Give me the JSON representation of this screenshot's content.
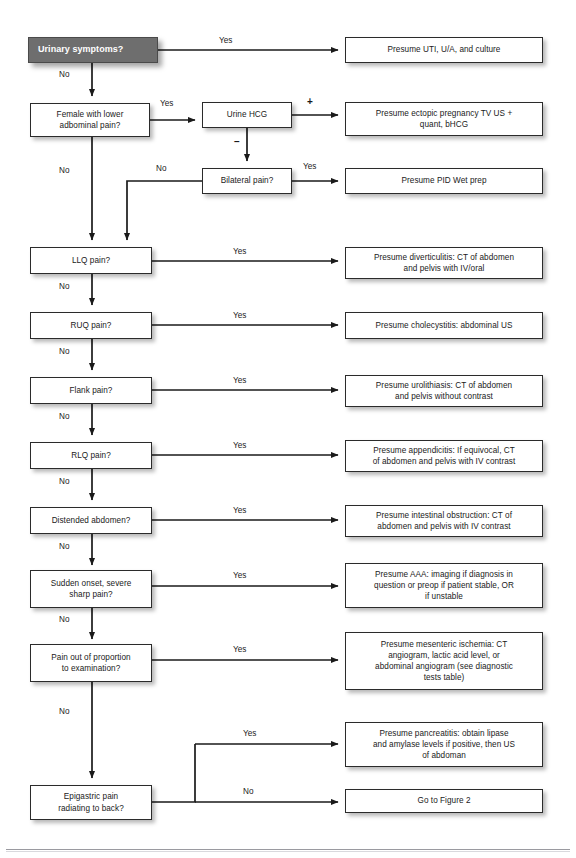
{
  "figure": {
    "accent_start_box": "#6e6e6e",
    "line_color": "#1a1a1a"
  },
  "nodes": {
    "urinary_symptoms": "Urinary symptoms?",
    "presume_uti": "Presume UTI, U/A, and culture",
    "female_lower_abd": "Female with lower\nadbominal pain?",
    "urine_hcg": "Urine HCG",
    "presume_ectopic": "Presume ectopic pregnancy TV US +\nquant, bHCG",
    "bilateral_pain": "Bilateral pain?",
    "presume_pid": "Presume PID Wet prep",
    "llq_pain": "LLQ pain?",
    "presume_diverticulitis": "Presume diverticulitis: CT of abdomen\nand pelvis with IV/oral",
    "ruq_pain": "RUQ pain?",
    "presume_cholecystitis": "Presume cholecystitis: abdominal US",
    "flank_pain": "Flank pain?",
    "presume_urolithiasis": "Presume urolithiasis: CT of abdomen\nand pelvis without contrast",
    "rlq_pain": "RLQ pain?",
    "presume_appendicitis": "Presume appendicitis: If equivocal, CT\nof abdomen and pelvis with IV contrast",
    "distended_abdomen": "Distended abdomen?",
    "presume_obstruction": "Presume intestinal obstruction: CT of\nabdomen and pelvis with IV contrast",
    "sudden_onset": "Sudden onset, severe\nsharp pain?",
    "presume_aaa": "Presume AAA: imaging if diagnosis in\nquestion or preop if patient stable, OR\nif unstable",
    "pain_out_of_proportion": "Pain out of proportion\nto examination?",
    "presume_mesenteric": "Presume mesenteric ischemia: CT\nangiogram, lactic acid level, or\nabdominal angiogram (see diagnostic\ntests table)",
    "presume_pancreatitis": "Presume pancreatitis: obtain lipase\nand amylase levels if positive, then US\nof abdoman",
    "epigastric_pain": "Epigastric pain\nradiating to back?",
    "go_to_figure2": "Go to Figure 2"
  },
  "edge_labels": {
    "yes_urinary": "Yes",
    "no_urinary": "No",
    "yes_female": "Yes",
    "no_female": "No",
    "hcg_positive": "+",
    "hcg_negative": "–",
    "yes_bilateral": "Yes",
    "no_bilateral": "No",
    "yes_llq": "Yes",
    "no_llq": "No",
    "yes_ruq": "Yes",
    "no_ruq": "No",
    "yes_flank": "Yes",
    "no_flank": "No",
    "yes_rlq": "Yes",
    "no_rlq": "No",
    "yes_distended": "Yes",
    "no_distended": "No",
    "yes_sudden": "Yes",
    "no_sudden": "No",
    "yes_proportion": "Yes",
    "no_proportion": "No",
    "yes_epigastric": "Yes",
    "no_epigastric": "No"
  }
}
